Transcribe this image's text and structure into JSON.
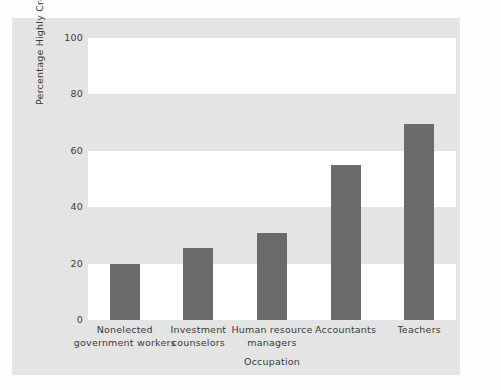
{
  "chart_data": {
    "type": "bar",
    "title": "",
    "xlabel": "Occupation",
    "ylabel": "Percentage Highly Credible",
    "categories": [
      "Nonelected\ngovernment workers",
      "Investment\ncounselors",
      "Human resource\nmanagers",
      "Accountants",
      "Teachers"
    ],
    "values": [
      20,
      25.5,
      31,
      55,
      69.5
    ],
    "ylim": [
      0,
      100
    ],
    "yticks": [
      0,
      20,
      40,
      60,
      80,
      100
    ],
    "ytick_labels": [
      "0",
      "20",
      "40",
      "60",
      "80",
      "100"
    ],
    "grid": false,
    "banding": "alternating horizontal white/gray bands every 20 units",
    "legend": "none",
    "bar_color": "#6b6b6b",
    "panel_color": "#e4e4e4",
    "band_white": "#ffffff",
    "band_gray": "#e4e4e4",
    "text_color": "#3a3a3a"
  }
}
